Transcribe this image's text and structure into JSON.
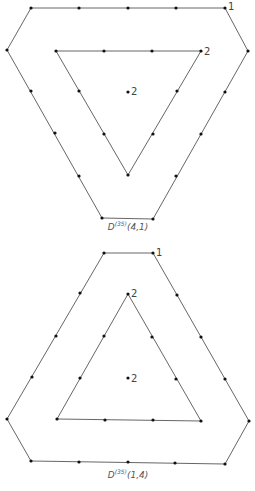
{
  "figures": [
    {
      "id": "top",
      "caption": {
        "base": "D",
        "sup": "(35)",
        "args": "(4,1)",
        "x": 128,
        "y": 230
      },
      "outer_polygon": [
        [
          31,
          8
        ],
        [
          225,
          8
        ],
        [
          248,
          51
        ],
        [
          153,
          219
        ],
        [
          102,
          218
        ],
        [
          7,
          50
        ]
      ],
      "inner_polygon": [
        [
          56,
          51
        ],
        [
          201,
          51
        ],
        [
          128,
          175
        ]
      ],
      "points": [
        [
          31,
          8
        ],
        [
          79,
          8
        ],
        [
          128,
          8
        ],
        [
          176,
          8
        ],
        [
          225,
          8
        ],
        [
          248,
          51
        ],
        [
          225,
          92
        ],
        [
          201,
          134
        ],
        [
          176,
          176
        ],
        [
          153,
          219
        ],
        [
          102,
          218
        ],
        [
          79,
          176
        ],
        [
          55,
          133
        ],
        [
          31,
          91
        ],
        [
          7,
          50
        ],
        [
          56,
          51
        ],
        [
          104,
          51
        ],
        [
          152,
          51
        ],
        [
          201,
          51
        ],
        [
          177,
          91
        ],
        [
          153,
          134
        ],
        [
          128,
          175
        ],
        [
          104,
          134
        ],
        [
          79,
          91
        ],
        [
          128,
          92
        ]
      ],
      "labels": [
        {
          "text": "1",
          "x": 228,
          "y": 10
        },
        {
          "text": "2",
          "x": 204,
          "y": 55
        },
        {
          "text": "2",
          "x": 131,
          "y": 95
        }
      ]
    },
    {
      "id": "bottom",
      "caption": {
        "base": "D",
        "sup": "(35)",
        "args": "(1,4)",
        "x": 128,
        "y": 478
      },
      "outer_polygon": [
        [
          104,
          253
        ],
        [
          153,
          253
        ],
        [
          249,
          421
        ],
        [
          225,
          464
        ],
        [
          31,
          461
        ],
        [
          7,
          419
        ]
      ],
      "inner_polygon": [
        [
          128,
          294
        ],
        [
          201,
          421
        ],
        [
          57,
          419
        ]
      ],
      "points": [
        [
          104,
          253
        ],
        [
          153,
          253
        ],
        [
          177,
          295
        ],
        [
          201,
          337
        ],
        [
          225,
          379
        ],
        [
          249,
          421
        ],
        [
          225,
          464
        ],
        [
          175,
          463
        ],
        [
          128,
          462
        ],
        [
          79,
          462
        ],
        [
          31,
          461
        ],
        [
          7,
          419
        ],
        [
          32,
          377
        ],
        [
          56,
          336
        ],
        [
          80,
          293
        ],
        [
          128,
          294
        ],
        [
          152,
          337
        ],
        [
          176,
          379
        ],
        [
          201,
          421
        ],
        [
          153,
          420
        ],
        [
          105,
          420
        ],
        [
          57,
          419
        ],
        [
          80,
          378
        ],
        [
          104,
          336
        ],
        [
          128,
          378
        ]
      ],
      "labels": [
        {
          "text": "1",
          "x": 156,
          "y": 256
        },
        {
          "text": "2",
          "x": 131,
          "y": 297
        },
        {
          "text": "2",
          "x": 131,
          "y": 382
        }
      ]
    }
  ]
}
